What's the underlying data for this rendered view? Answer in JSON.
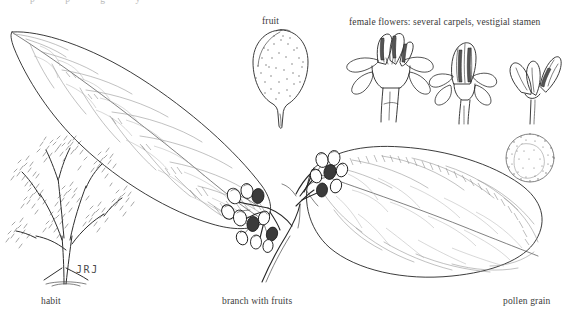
{
  "plate": {
    "title": "Botanical illustration plate",
    "background_color": "#ffffff",
    "ink_color": "#262626",
    "artist_signature": "JRJ",
    "cropped_top_caption": "p p g y"
  },
  "labels": {
    "fruit": "fruit",
    "female_flowers": "female flowers: several carpels, vestigial stamen",
    "habit": "habit",
    "branch_with_fruits": "branch with fruits",
    "pollen_grain": "pollen grain"
  },
  "figures": [
    {
      "name": "habit",
      "caption": "habit",
      "description": "small spreading tree with many fine foliage clusters"
    },
    {
      "name": "leaf-left",
      "caption": "",
      "description": "large elliptic acuminate leaf, reticulate venation"
    },
    {
      "name": "fruit",
      "caption": "fruit",
      "description": "pear shaped stipple shaded fruit on a stalk"
    },
    {
      "name": "female-flower-open",
      "caption": "",
      "description": "open female flower showing several carpels"
    },
    {
      "name": "female-flower-bud",
      "caption": "",
      "description": "female flower with petals and closed carpel cluster"
    },
    {
      "name": "female-flower-dissected",
      "caption": "",
      "description": "dissected female flower, vestigial stamen"
    },
    {
      "name": "pollen-grain",
      "caption": "pollen grain",
      "description": "spherical stippled pollen grain"
    },
    {
      "name": "branch-with-fruits",
      "caption": "branch with fruits",
      "description": "branch bearing two leaves and clusters of small ovoid fruits"
    }
  ]
}
